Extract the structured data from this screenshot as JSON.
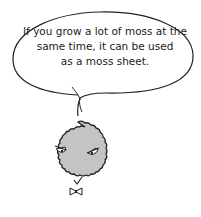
{
  "speech_bubble": {
    "lines": [
      "If you grow a lot of moss at the",
      "same time, it can be used",
      "as a moss sheet."
    ]
  },
  "character": {
    "name": "moss-ball",
    "fill_color": "#c4c4c4",
    "outline_color": "#222222",
    "expression": "stern",
    "accessory": "bow-tie"
  }
}
